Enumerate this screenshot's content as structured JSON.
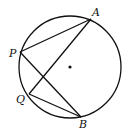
{
  "diagram": {
    "circle": {
      "cx": 70,
      "cy": 67,
      "r": 51
    },
    "center_dot": {
      "x": 70,
      "y": 67
    },
    "points": {
      "A": {
        "label": "A",
        "x": 91,
        "y": 19,
        "lx": 92,
        "ly": 16
      },
      "P": {
        "label": "P",
        "x": 20,
        "y": 52,
        "lx": 9,
        "ly": 57
      },
      "Q": {
        "label": "Q",
        "x": 29,
        "y": 94,
        "lx": 16,
        "ly": 103
      },
      "B": {
        "label": "B",
        "x": 81,
        "y": 117,
        "lx": 79,
        "ly": 128
      }
    },
    "segments": [
      "PA",
      "PB",
      "QA",
      "QB"
    ],
    "stroke_color": "#111111"
  }
}
